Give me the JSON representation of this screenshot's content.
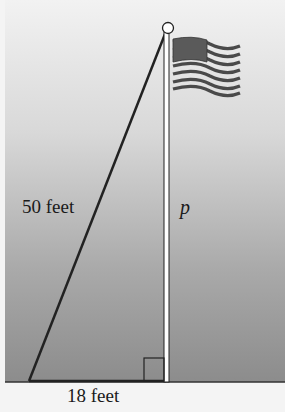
{
  "figure": {
    "labels": {
      "hypotenuse": "50 feet",
      "pole_height": "p",
      "base": "18 feet"
    },
    "geometry": {
      "hypotenuse_length": 50,
      "base_length": 18,
      "height_variable": "p",
      "right_angle_at": "base of pole"
    },
    "icons": [
      "flag-icon",
      "pole-top-ball-icon",
      "right-angle-marker-icon"
    ],
    "colors": {
      "background_top": "#f2f2f2",
      "background_bottom": "#8f8f8f",
      "ground_strip": "#f4f4f4",
      "line": "#222222",
      "flag_canton": "#5a5a5a",
      "flag_stripe_dark": "#4a4a4a"
    }
  }
}
